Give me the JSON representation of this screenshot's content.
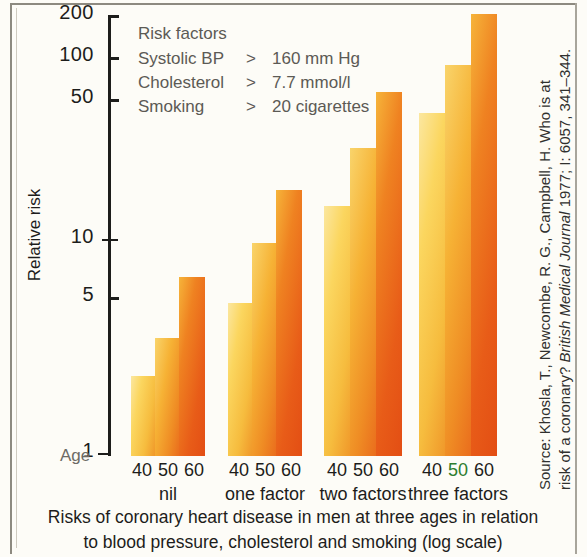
{
  "chart_data": {
    "type": "bar",
    "title": "Risks of coronary heart disease in men at three ages in relation to blood pressure, cholesterol and smoking (log scale)",
    "xlabel": "Age",
    "ylabel": "Relative risk",
    "yscale": "log",
    "ylim": [
      1,
      200
    ],
    "yticks": [
      1,
      5,
      10,
      50,
      100,
      200
    ],
    "ytick_labels": [
      "1",
      "5",
      "10",
      "50",
      "100",
      "200"
    ],
    "grid": false,
    "legend_position": "inside-top-left",
    "categories": [
      "nil",
      "one factor",
      "two factors",
      "three factors"
    ],
    "subcategories": [
      "40",
      "50",
      "60"
    ],
    "series": [
      {
        "name": "40",
        "values": [
          2,
          6,
          17,
          50
        ]
      },
      {
        "name": "50",
        "values": [
          2.5,
          11,
          34,
          90
        ]
      },
      {
        "name": "60",
        "values": [
          4,
          23,
          60,
          200
        ]
      }
    ],
    "annotations": {
      "risk_factor_note": "Risk factors: Systolic BP > 160 mm Hg; Cholesterol > 7.7 mmol/l; Smoking > 20 cigarettes"
    }
  },
  "axis": {
    "y_label": "Relative risk",
    "age_label": "Age",
    "ticks": [
      {
        "value": "200",
        "y": 15
      },
      {
        "value": "100",
        "y": 57
      },
      {
        "value": "50",
        "y": 99
      },
      {
        "value": "10",
        "y": 239
      },
      {
        "value": "5",
        "y": 297
      },
      {
        "value": "1",
        "y": 453
      }
    ]
  },
  "legend": {
    "title": "Risk factors",
    "rows": [
      {
        "factor": "Systolic BP",
        "op": ">",
        "value": "160 mm Hg"
      },
      {
        "factor": "Cholesterol",
        "op": ">",
        "value": "7.7 mmol/l"
      },
      {
        "factor": "Smoking",
        "op": ">",
        "value": "20 cigarettes"
      }
    ]
  },
  "groups": [
    {
      "label": "nil",
      "ages": [
        "40",
        "50",
        "60"
      ],
      "bars": [
        {
          "age": "40",
          "value": 2,
          "top": 376,
          "left": 131,
          "width": 24
        },
        {
          "age": "50",
          "value": 2.5,
          "top": 338,
          "left": 155,
          "width": 24
        },
        {
          "age": "60",
          "value": 4,
          "top": 277,
          "left": 179,
          "width": 26
        }
      ]
    },
    {
      "label": "one factor",
      "ages": [
        "40",
        "50",
        "60"
      ],
      "bars": [
        {
          "age": "40",
          "value": 6,
          "top": 303,
          "left": 228,
          "width": 24
        },
        {
          "age": "50",
          "value": 11,
          "top": 243,
          "left": 252,
          "width": 24
        },
        {
          "age": "60",
          "value": 23,
          "top": 190,
          "left": 276,
          "width": 26
        }
      ]
    },
    {
      "label": "two factors",
      "ages": [
        "40",
        "50",
        "60"
      ],
      "bars": [
        {
          "age": "40",
          "value": 17,
          "top": 206,
          "left": 324,
          "width": 26
        },
        {
          "age": "50",
          "value": 34,
          "top": 148,
          "left": 350,
          "width": 26
        },
        {
          "age": "60",
          "value": 60,
          "top": 92,
          "left": 376,
          "width": 26
        }
      ]
    },
    {
      "label": "three factors",
      "ages": [
        "40",
        "50",
        "60"
      ],
      "bars": [
        {
          "age": "40",
          "value": 50,
          "top": 113,
          "left": 419,
          "width": 26
        },
        {
          "age": "50",
          "value": 90,
          "top": 65,
          "left": 445,
          "width": 26
        },
        {
          "age": "60",
          "value": 200,
          "top": 14,
          "left": 471,
          "width": 26
        }
      ]
    }
  ],
  "source": {
    "line1_a": "Source: Khosla, T., Newcombe, R. G., Campbell, H. Who is at",
    "line2_a": "risk of a coronary? ",
    "line2_italic": "British Medical Journal",
    "line2_b": " 1977; I: 6057, 341–344."
  },
  "caption": {
    "line1": "Risks of coronary heart disease in men at three ages in relation",
    "line2": "to blood pressure, cholesterol and smoking (log scale)"
  },
  "colors": {
    "bar_light": "#fbd560",
    "bar_mid": "#f09326",
    "bar_dark": "#e34e14",
    "axis": "#1d1d1b",
    "legend_text": "#5c5a55",
    "background": "#fdfcf7"
  }
}
